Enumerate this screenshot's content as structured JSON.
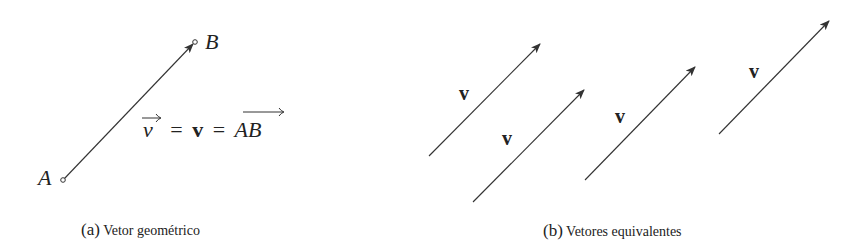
{
  "figure_a": {
    "point_a_label": "A",
    "point_b_label": "B",
    "equation": {
      "lhs": "v",
      "middle": "v",
      "rhs": "AB",
      "equals": "="
    },
    "caption_tag": "(a)",
    "caption_text": "Vetor geométrico"
  },
  "figure_b": {
    "vectors": [
      {
        "label": "v"
      },
      {
        "label": "v"
      },
      {
        "label": "v"
      },
      {
        "label": "v"
      }
    ],
    "caption_tag": "(b)",
    "caption_text": "Vetores equivalentes"
  },
  "colors": {
    "stroke": "#333333",
    "text": "#222222"
  }
}
